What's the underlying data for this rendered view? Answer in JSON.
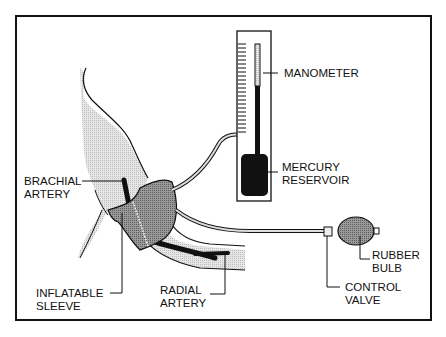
{
  "diagram": {
    "labels": {
      "manometer": "MANOMETER",
      "mercury_reservoir_line1": "MERCURY",
      "mercury_reservoir_line2": "RESERVOIR",
      "brachial_artery_line1": "BRACHIAL",
      "brachial_artery_line2": "ARTERY",
      "inflatable_sleeve_line1": "INFLATABLE",
      "inflatable_sleeve_line2": "SLEEVE",
      "radial_artery_line1": "RADIAL",
      "radial_artery_line2": "ARTERY",
      "rubber_bulb_line1": "RUBBER",
      "rubber_bulb_line2": "BULB",
      "control_valve_line1": "CONTROL",
      "control_valve_line2": "VALVE"
    },
    "colors": {
      "ink": "#111111",
      "arm_fill": "#d9d9d9",
      "cuff_fill": "#8c8c8c",
      "bulb_fill": "#8f8f8f",
      "mercury": "#111111"
    }
  }
}
